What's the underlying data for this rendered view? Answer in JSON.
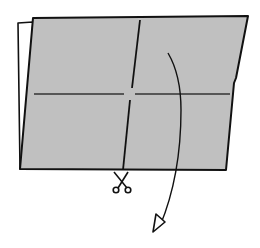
{
  "diagram": {
    "type": "origami-instruction-step",
    "colors": {
      "paper_front": "#c0c0c0",
      "paper_back": "#ffffff",
      "ink": "#111111"
    },
    "elements": [
      {
        "id": "back-sheet",
        "label": "white back layer"
      },
      {
        "id": "front-sheet",
        "label": "gray front layer"
      },
      {
        "id": "horizontal-crease",
        "label": "horizontal crease line"
      },
      {
        "id": "vertical-cut-line",
        "label": "vertical cut line"
      },
      {
        "id": "scissors",
        "label": "cut here symbol"
      },
      {
        "id": "fold-arrow",
        "label": "curved fold arrow"
      }
    ]
  }
}
